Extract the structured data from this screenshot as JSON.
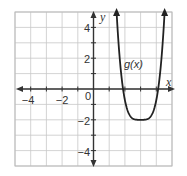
{
  "chart_data": {
    "type": "line",
    "title": "",
    "xlabel": "x",
    "ylabel": "y",
    "xlim": [
      -5,
      5
    ],
    "ylim": [
      -5,
      5
    ],
    "grid": true,
    "x_tick_labels": [
      "−4",
      "−2",
      "0"
    ],
    "y_tick_labels": [
      "4",
      "2",
      "−2",
      "−4"
    ],
    "series": [
      {
        "name": "g(x)",
        "function_form": "a(x − 3)^4 − 2, a ≈ 1.4",
        "vertex": [
          3,
          -2
        ],
        "x_intercepts": [
          1.9,
          4.1
        ],
        "x": [
          1.47,
          1.6,
          1.8,
          1.9,
          2.0,
          2.2,
          2.4,
          2.6,
          2.8,
          3.0,
          3.2,
          3.4,
          3.6,
          3.8,
          4.0,
          4.1,
          4.2,
          4.4,
          4.53
        ],
        "y": [
          5.0,
          3.38,
          0.9,
          0.05,
          -0.6,
          -1.43,
          -1.82,
          -1.96,
          -2.0,
          -2.0,
          -2.0,
          -1.96,
          -1.82,
          -1.43,
          -0.6,
          0.05,
          0.9,
          3.38,
          5.0
        ],
        "ends_with_arrows": true
      }
    ],
    "annotations": [
      {
        "text": "g(x)",
        "x": 2.0,
        "y": 1.7
      }
    ]
  },
  "labels": {
    "x_axis": "x",
    "y_axis": "y",
    "origin": "0",
    "function": "g(x)",
    "x_ticks": [
      {
        "value": -4,
        "text": "−4"
      },
      {
        "value": -2,
        "text": "−2"
      }
    ],
    "y_ticks": [
      {
        "value": 4,
        "text": "4"
      },
      {
        "value": 2,
        "text": "2"
      },
      {
        "value": -2,
        "text": "−2"
      },
      {
        "value": -4,
        "text": "−4"
      }
    ]
  },
  "colors": {
    "grid": "#c8c8c8",
    "axis": "#333333",
    "curve": "#222222",
    "border": "#bbbbbb"
  }
}
